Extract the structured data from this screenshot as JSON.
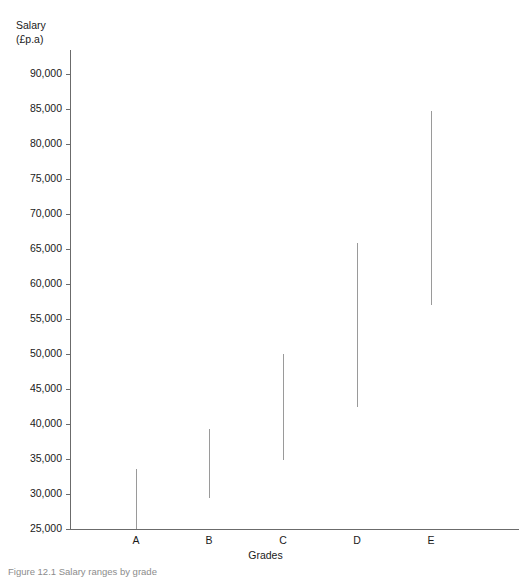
{
  "chart_data": {
    "type": "bar",
    "subtype": "range-floating-bar",
    "title": "",
    "xlabel": "Grades",
    "ylabel": "Salary\n(£p.a)",
    "ylabel_line1": "Salary",
    "ylabel_line2": "(£p.a)",
    "categories": [
      "A",
      "B",
      "C",
      "D",
      "E"
    ],
    "ylim": [
      25000,
      92000
    ],
    "ytick_step": 5000,
    "ytick_labels": [
      "90,000",
      "85,000",
      "80,000",
      "75,000",
      "70,000",
      "65,000",
      "60,000",
      "55,000",
      "50,000",
      "45,000",
      "40,000",
      "35,000",
      "30,000",
      "25,000"
    ],
    "ytick_values": [
      90000,
      85000,
      80000,
      75000,
      70000,
      65000,
      60000,
      55000,
      50000,
      45000,
      40000,
      35000,
      30000,
      25000
    ],
    "grid": false,
    "legend": false,
    "series": [
      {
        "name": "Salary range",
        "low": [
          25000,
          29500,
          34800,
          42400,
          57000
        ],
        "high": [
          33600,
          39300,
          50000,
          65800,
          84700
        ]
      }
    ],
    "ranges": [
      {
        "category": "A",
        "low": 25000,
        "high": 33600
      },
      {
        "category": "B",
        "low": 29500,
        "high": 39300
      },
      {
        "category": "C",
        "low": 34800,
        "high": 50000
      },
      {
        "category": "D",
        "low": 42400,
        "high": 65800
      },
      {
        "category": "E",
        "low": 57000,
        "high": 84700
      }
    ],
    "colors": {
      "axis": "#6b6b6b",
      "bar": "#9a9a9a",
      "text": "#1a1a1a",
      "background": "#ffffff"
    }
  },
  "caption": {
    "text": "Figure 12.1 Salary ranges by grade"
  }
}
